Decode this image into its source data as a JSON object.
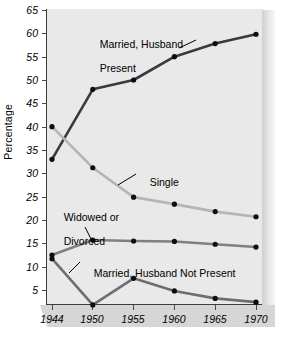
{
  "chart_data": {
    "type": "line",
    "title": "",
    "xlabel": "",
    "ylabel": "Percentage",
    "categories": [
      "1944",
      "1950",
      "1955",
      "1960",
      "1965",
      "1970"
    ],
    "x": [
      1944,
      1950,
      1955,
      1960,
      1965,
      1970
    ],
    "ylim": [
      0,
      65
    ],
    "yticks": [
      5,
      10,
      15,
      20,
      25,
      30,
      35,
      40,
      45,
      50,
      55,
      60,
      65
    ],
    "grid": false,
    "legend_position": "inline-annotations",
    "series": [
      {
        "name": "Married, Husband Present",
        "values": [
          33.0,
          48.0,
          50.0,
          55.0,
          57.8,
          59.8
        ],
        "color": "#3a3a3a"
      },
      {
        "name": "Single",
        "values": [
          40.0,
          31.2,
          24.9,
          23.4,
          21.8,
          20.7
        ],
        "color": "#b5b5b5"
      },
      {
        "name": "Widowed or Divorced",
        "values": [
          12.5,
          15.7,
          15.5,
          15.4,
          14.8,
          14.2
        ],
        "color": "#808080"
      },
      {
        "name": "Married, Husband Not Present",
        "values": [
          11.7,
          1.8,
          7.5,
          4.8,
          3.2,
          2.4
        ],
        "color": "#6e6e6e"
      }
    ],
    "annotations": [
      {
        "text": "Married, Husband\nPresent",
        "series": "Married, Husband Present"
      },
      {
        "text": "Single",
        "series": "Single"
      },
      {
        "text": "Widowed or\nDivorced",
        "series": "Widowed or Divorced"
      },
      {
        "text": "Married, Husband Not Present",
        "series": "Married, Husband Not Present"
      }
    ]
  },
  "axis": {
    "y_title": "Percentage",
    "y_labels": [
      "65",
      "60",
      "55",
      "50",
      "45",
      "40",
      "35",
      "30",
      "25",
      "20",
      "15",
      "10",
      "5"
    ],
    "x_labels": [
      "1944",
      "1950",
      "1955",
      "1960",
      "1965",
      "1970"
    ]
  },
  "labels": {
    "married_husband_present_line1": "Married, Husband",
    "married_husband_present_line2": "Present",
    "single": "Single",
    "widowed_line1": "Widowed or",
    "widowed_line2": "Divorced",
    "married_not_present": "Married, Husband Not Present"
  },
  "colors": {
    "series_married_present": "#3a3a3a",
    "series_single": "#b5b5b5",
    "series_widowed": "#808080",
    "series_married_not_present": "#6e6e6e",
    "plot_background": "#e9e9e9",
    "axis": "#3c3c3c"
  }
}
